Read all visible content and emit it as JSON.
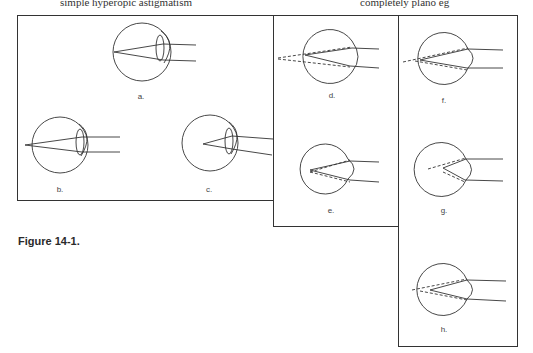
{
  "header_fragment": {
    "left": "simple hyperopic astigmatism",
    "right": "completely plano eg"
  },
  "figure": {
    "caption": "Figure 14-1.",
    "panels": [
      {
        "id": "a",
        "label": "a."
      },
      {
        "id": "b",
        "label": "b."
      },
      {
        "id": "c",
        "label": "c."
      },
      {
        "id": "d",
        "label": "d."
      },
      {
        "id": "e",
        "label": "e."
      },
      {
        "id": "f",
        "label": "f."
      },
      {
        "id": "g",
        "label": "g."
      },
      {
        "id": "h",
        "label": "h."
      }
    ]
  },
  "colors": {
    "line": "#333333",
    "background": "#ffffff"
  }
}
